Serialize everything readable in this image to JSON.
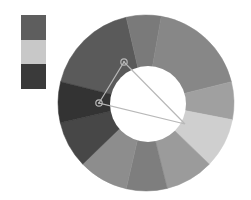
{
  "swatches": [
    {
      "name": "swatch-1",
      "color": "#5e5e5e"
    },
    {
      "name": "swatch-2",
      "color": "#c8c8c8"
    },
    {
      "name": "swatch-3",
      "color": "#3a3a3a"
    }
  ],
  "wheel": {
    "center": [
      146,
      103
    ],
    "outer_radius": 88,
    "inner_center": [
      148,
      104
    ],
    "inner_radius": 38,
    "segments": [
      {
        "start": -166,
        "end": -103,
        "color": "#5a5a5a"
      },
      {
        "start": -103,
        "end": -80,
        "color": "#7a7a7a"
      },
      {
        "start": -80,
        "end": -14,
        "color": "#878787"
      },
      {
        "start": -14,
        "end": 11,
        "color": "#a0a0a0"
      },
      {
        "start": 11,
        "end": 44,
        "color": "#cfcfcf"
      },
      {
        "start": 44,
        "end": 76,
        "color": "#9b9b9b"
      },
      {
        "start": 76,
        "end": 103,
        "color": "#7e7e7e"
      },
      {
        "start": 103,
        "end": 136,
        "color": "#8d8d8d"
      },
      {
        "start": 136,
        "end": 167,
        "color": "#474747"
      },
      {
        "start": 167,
        "end": 194,
        "color": "#333333"
      }
    ],
    "harmony": {
      "line_color": "#b8b8b8",
      "handles": [
        [
          124,
          62
        ],
        [
          99,
          103
        ]
      ],
      "apex": [
        185,
        124
      ]
    }
  }
}
